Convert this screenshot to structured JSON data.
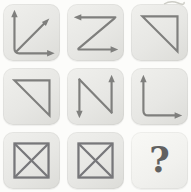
{
  "puzzle": {
    "kind": "3x3-matrix-reasoning-puzzle",
    "grid": {
      "rows": 3,
      "cols": 3,
      "cells": [
        {
          "row": 1,
          "col": 1,
          "figure": "axes-with-diagonal-arrow",
          "description": "up arrow and right arrow forming axes joined at bottom-left, plus diagonal arrow pointing up-right"
        },
        {
          "row": 1,
          "col": 2,
          "figure": "z-arrows",
          "description": "Z shape: top line with left arrowhead, diagonal from top-right to bottom-left, bottom line with right arrowhead"
        },
        {
          "row": 1,
          "col": 3,
          "figure": "right-triangle",
          "description": "triangle with top edge, right edge and hypotenuse from top-left to bottom-right"
        },
        {
          "row": 2,
          "col": 1,
          "figure": "right-triangle",
          "description": "triangle with top edge, right edge and hypotenuse from top-left to bottom-right"
        },
        {
          "row": 2,
          "col": 2,
          "figure": "n-arrows",
          "description": "N shape: left vertical with down arrowhead, diagonal from top-left to bottom-right, right vertical with up arrowhead"
        },
        {
          "row": 2,
          "col": 3,
          "figure": "l-axes",
          "description": "axes: vertical line with up arrowhead and horizontal line with right arrowhead joined at bottom-left"
        },
        {
          "row": 3,
          "col": 1,
          "figure": "boxed-x",
          "description": "square with both diagonals drawn (X inside box)"
        },
        {
          "row": 3,
          "col": 2,
          "figure": "boxed-x",
          "description": "square with both diagonals drawn (X inside box)"
        },
        {
          "row": 3,
          "col": 3,
          "figure": "question-mark",
          "label": "?",
          "description": "bold question mark marking the missing answer cell"
        }
      ]
    },
    "colors": {
      "page_bg": "#fcfcfa",
      "tile_bg": "#e7e7e4",
      "answer_tile_bg": "#f4f4f1",
      "stroke": "#7f7f7d",
      "box_stroke": "#77777a",
      "question_mark": "#616161"
    }
  }
}
